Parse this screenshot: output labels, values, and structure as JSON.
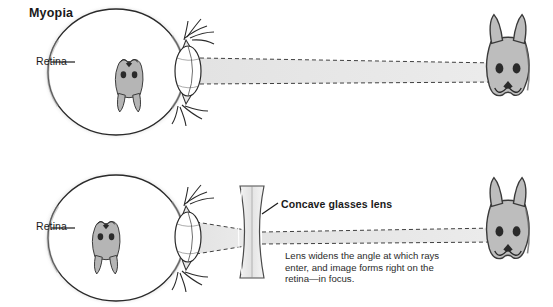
{
  "figure": {
    "title": "Myopia",
    "background_color": "#ffffff",
    "ink_color": "#1a1a1a",
    "ray_band_color": "#e2e2e2",
    "sclera_color": "#ffffff",
    "shadow_color": "#b9b9b9",
    "object_fill": "#bdbdbd"
  },
  "panels": [
    {
      "id": "uncorrected",
      "name": "myopia-uncorrected-panel",
      "title": "Myopia",
      "retina_label": "Retina",
      "object_name": "rabbit-face",
      "image_position": "in front of retina",
      "has_glasses_lens": false
    },
    {
      "id": "corrected",
      "name": "myopia-corrected-panel",
      "retina_label": "Retina",
      "lens_label": "Concave glasses lens",
      "caption": "Lens widens the angle at which rays enter, and image forms right on the retina—in focus.",
      "object_name": "rabbit-face",
      "image_position": "on retina",
      "has_glasses_lens": true
    }
  ],
  "labels": {
    "retina_top": "Retina",
    "retina_bottom": "Retina",
    "concave_lens": "Concave glasses lens",
    "caption_bottom": "Lens widens the angle at which rays enter, and image forms right on the retina—in focus."
  }
}
